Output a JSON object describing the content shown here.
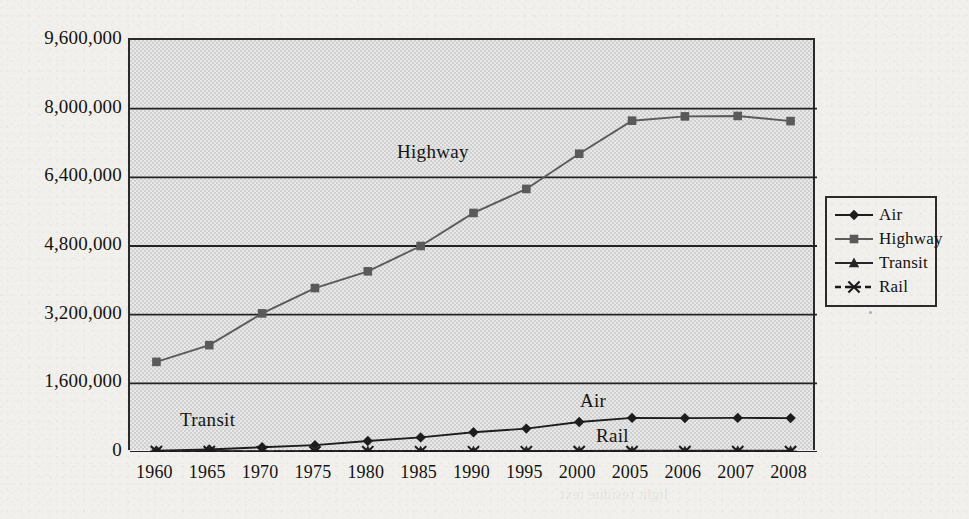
{
  "chart_data": {
    "type": "line",
    "title": "",
    "subtitle": "",
    "xlabel": "",
    "ylabel": "",
    "categories": [
      "1960",
      "1965",
      "1970",
      "1975",
      "1980",
      "1985",
      "1990",
      "1995",
      "2000",
      "2005",
      "2006",
      "2007",
      "2008"
    ],
    "ylim": [
      0,
      9600000
    ],
    "ytick_values": [
      0,
      1600000,
      3200000,
      4800000,
      6400000,
      8000000,
      9600000
    ],
    "ytick_labels": [
      "0",
      "1,600,000",
      "3,200,000",
      "4,800,000",
      "6,400,000",
      "8,000,000",
      "9,600,000"
    ],
    "grid": "horizontal",
    "legend_position": "right-outside",
    "plot_background": "#cfcfcf",
    "series": [
      {
        "name": "Air",
        "marker": "diamond",
        "line_style": "solid",
        "color": "#1d1d1d",
        "values": [
          30000,
          58000,
          110000,
          160000,
          255000,
          340000,
          460000,
          545000,
          700000,
          795000,
          790000,
          795000,
          790000
        ]
      },
      {
        "name": "Highway",
        "marker": "square",
        "line_style": "solid",
        "color": "#5a5a5a",
        "values": [
          2100000,
          2490000,
          3230000,
          3820000,
          4210000,
          4800000,
          5570000,
          6130000,
          6950000,
          7720000,
          7820000,
          7830000,
          7710000
        ]
      },
      {
        "name": "Transit",
        "marker": "triangle",
        "line_style": "solid",
        "color": "#262626",
        "values": [
          25000,
          22000,
          20000,
          22000,
          25000,
          25000,
          26000,
          26000,
          27000,
          28000,
          28000,
          29000,
          29000
        ]
      },
      {
        "name": "Rail",
        "marker": "cross",
        "line_style": "dashed",
        "color": "#1a1a1a",
        "values": [
          8000,
          7000,
          6500,
          6000,
          6500,
          6500,
          6500,
          6500,
          7000,
          7000,
          7000,
          7000,
          7000
        ]
      }
    ],
    "annotations": [
      {
        "text": "Highway",
        "series": "Highway",
        "x_px": 395,
        "y_px": 140
      },
      {
        "text": "Transit",
        "series": "Transit",
        "x_px": 178,
        "y_px": 408
      },
      {
        "text": "Air",
        "series": "Air",
        "x_px": 578,
        "y_px": 389
      },
      {
        "text": "Rail",
        "series": "Rail",
        "x_px": 594,
        "y_px": 424
      }
    ]
  },
  "legend": {
    "items": [
      {
        "label": "Air",
        "marker": "diamond",
        "line_style": "solid"
      },
      {
        "label": "Highway",
        "marker": "square",
        "line_style": "solid"
      },
      {
        "label": "Transit",
        "marker": "triangle",
        "line_style": "solid"
      },
      {
        "label": "Rail",
        "marker": "cross",
        "line_style": "dashed"
      }
    ]
  },
  "page": {
    "background_color": "#f1f0ed",
    "ink_color": "#15130f",
    "bleed_through_text": [
      {
        "text": "reverse-page show-through",
        "x_px": 640,
        "y_px": 52
      },
      {
        "text": "scanned paper texture",
        "x_px": 300,
        "y_px": 196
      },
      {
        "text": "faint ghost lettering",
        "x_px": 180,
        "y_px": 248
      },
      {
        "text": "verso line of type",
        "x_px": 470,
        "y_px": 236
      },
      {
        "text": "show through here",
        "x_px": 60,
        "y_px": 300
      },
      {
        "text": "light residue text",
        "x_px": 560,
        "y_px": 486
      }
    ]
  }
}
